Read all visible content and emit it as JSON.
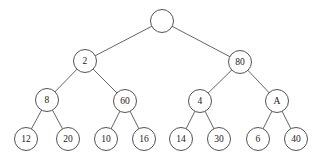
{
  "diagram": {
    "type": "binary-tree",
    "background_color": "#ffffff",
    "node_fill_color": "#ffffff",
    "node_stroke_color": "#4a4a4a",
    "edge_color": "#545454",
    "label_color": "#1a1a1a",
    "node_radius": 11.5,
    "leaf_radius": 11.5,
    "nodes": [
      {
        "id": "root",
        "label": "",
        "x": 162,
        "y": 21,
        "r": 11.5,
        "level": 0
      },
      {
        "id": "n2",
        "label": "2",
        "x": 85,
        "y": 61,
        "r": 11.5,
        "level": 1
      },
      {
        "id": "n80",
        "label": "80",
        "x": 240,
        "y": 62,
        "r": 11.5,
        "level": 1
      },
      {
        "id": "n8",
        "label": "8",
        "x": 47,
        "y": 100,
        "r": 11.5,
        "level": 2
      },
      {
        "id": "n60",
        "label": "60",
        "x": 125,
        "y": 101,
        "r": 11.5,
        "level": 2
      },
      {
        "id": "n4",
        "label": "4",
        "x": 200,
        "y": 101,
        "r": 11.5,
        "level": 2
      },
      {
        "id": "nA",
        "label": "A",
        "x": 277,
        "y": 101,
        "r": 11.5,
        "level": 2
      },
      {
        "id": "n12",
        "label": "12",
        "x": 26,
        "y": 139,
        "r": 11.5,
        "level": 3
      },
      {
        "id": "n20",
        "label": "20",
        "x": 68,
        "y": 139,
        "r": 11.5,
        "level": 3
      },
      {
        "id": "n10",
        "label": "10",
        "x": 106,
        "y": 139,
        "r": 11.5,
        "level": 3
      },
      {
        "id": "n16",
        "label": "16",
        "x": 144,
        "y": 139,
        "r": 11.5,
        "level": 3
      },
      {
        "id": "n14",
        "label": "14",
        "x": 181,
        "y": 139,
        "r": 11.5,
        "level": 3
      },
      {
        "id": "n30",
        "label": "30",
        "x": 219,
        "y": 139,
        "r": 11.5,
        "level": 3
      },
      {
        "id": "n6",
        "label": "6",
        "x": 258,
        "y": 139,
        "r": 11.5,
        "level": 3
      },
      {
        "id": "n40",
        "label": "40",
        "x": 296,
        "y": 139,
        "r": 11.5,
        "level": 3
      }
    ],
    "edges": [
      {
        "from": "root",
        "to": "n2"
      },
      {
        "from": "root",
        "to": "n80"
      },
      {
        "from": "n2",
        "to": "n8"
      },
      {
        "from": "n2",
        "to": "n60"
      },
      {
        "from": "n80",
        "to": "n4"
      },
      {
        "from": "n80",
        "to": "nA"
      },
      {
        "from": "n8",
        "to": "n12"
      },
      {
        "from": "n8",
        "to": "n20"
      },
      {
        "from": "n60",
        "to": "n10"
      },
      {
        "from": "n60",
        "to": "n16"
      },
      {
        "from": "n4",
        "to": "n14"
      },
      {
        "from": "n4",
        "to": "n30"
      },
      {
        "from": "nA",
        "to": "n6"
      },
      {
        "from": "nA",
        "to": "n40"
      }
    ]
  }
}
